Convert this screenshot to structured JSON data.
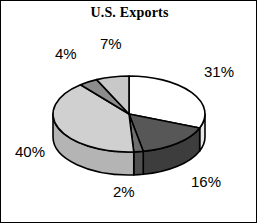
{
  "chart_data": {
    "type": "pie",
    "title": "U.S. Exports",
    "xlabel": "",
    "ylabel": "",
    "legend": "none",
    "grid": false,
    "three_d": true,
    "start_angle_deg": 0,
    "direction": "clockwise",
    "categories": [
      "31%",
      "16%",
      "2%",
      "40%",
      "4%",
      "7%"
    ],
    "values": [
      31,
      16,
      2,
      40,
      4,
      7
    ],
    "labels": [
      "31%",
      "16%",
      "2%",
      "40%",
      "4%",
      "7%"
    ],
    "slices": [
      {
        "label": "31%",
        "value": 31,
        "color": "#ffffff",
        "side_color": "#e8e8e8"
      },
      {
        "label": "16%",
        "value": 16,
        "color": "#575757",
        "side_color": "#3d3d3d"
      },
      {
        "label": "2%",
        "value": 2,
        "color": "#6e6e6e",
        "side_color": "#4f4f4f"
      },
      {
        "label": "40%",
        "value": 40,
        "color": "#d0d0d0",
        "side_color": "#b4b4b4"
      },
      {
        "label": "4%",
        "value": 4,
        "color": "#8c8c8c",
        "side_color": "#707070"
      },
      {
        "label": "7%",
        "value": 7,
        "color": "#c8c8c8",
        "side_color": "#ababab"
      }
    ]
  },
  "title": {
    "text": "U.S. Exports"
  },
  "labels": {
    "pct_31": "31%",
    "pct_16": "16%",
    "pct_2": "2%",
    "pct_40": "40%",
    "pct_4": "4%",
    "pct_7": "7%"
  },
  "colors": {
    "outline": "#000000",
    "background": "#ffffff",
    "text": "#000000"
  }
}
